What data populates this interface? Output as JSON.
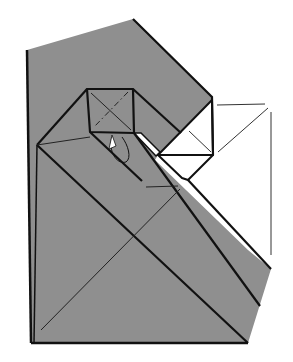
{
  "figure": {
    "type": "origami folding diagram",
    "colors": {
      "paper_front": "#8f8f8f",
      "paper_back": "#ffffff",
      "line": "#111111",
      "thin_line": "#333333",
      "background": "#ffffff"
    },
    "labels": []
  }
}
